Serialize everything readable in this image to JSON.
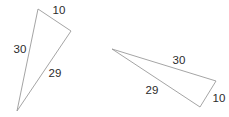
{
  "figure": {
    "background_color": "#ffffff",
    "stroke_color": "#9a9a9a",
    "label_color": "#2b2b2b",
    "triangles": [
      {
        "name": "left-triangle",
        "points": "38,9 71,31 17,111",
        "labels": [
          {
            "name": "left-triangle-side-10",
            "text": "10",
            "x": 59,
            "y": 11
          },
          {
            "name": "left-triangle-side-30",
            "text": "30",
            "x": 20,
            "y": 50
          },
          {
            "name": "left-triangle-side-29",
            "text": "29",
            "x": 55,
            "y": 74
          }
        ]
      },
      {
        "name": "right-triangle",
        "points": "112,49 216,81 200,107",
        "labels": [
          {
            "name": "right-triangle-side-30",
            "text": "30",
            "x": 179,
            "y": 61
          },
          {
            "name": "right-triangle-side-29",
            "text": "29",
            "x": 152,
            "y": 91
          },
          {
            "name": "right-triangle-side-10",
            "text": "10",
            "x": 219,
            "y": 99
          }
        ]
      }
    ]
  },
  "chart_data": {
    "type": "diagram",
    "shapes": [
      {
        "id": "left-triangle",
        "vertices": [
          [
            38,
            9
          ],
          [
            71,
            31
          ],
          [
            17,
            111
          ]
        ],
        "side_labels": [
          "10",
          "30",
          "29"
        ]
      },
      {
        "id": "right-triangle",
        "vertices": [
          [
            112,
            49
          ],
          [
            216,
            81
          ],
          [
            200,
            107
          ]
        ],
        "side_labels": [
          "30",
          "29",
          "10"
        ]
      }
    ]
  }
}
